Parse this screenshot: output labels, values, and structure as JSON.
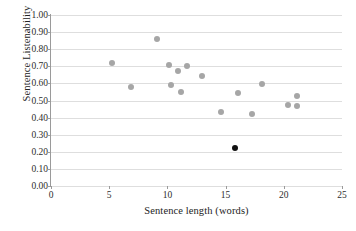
{
  "chart_data": {
    "type": "scatter",
    "title": "",
    "xlabel": "Sentence length (words)",
    "ylabel": "Sentence Listenability",
    "xlim": [
      0,
      25
    ],
    "ylim": [
      0.0,
      1.0
    ],
    "xticks": [
      0,
      5,
      10,
      15,
      20,
      25
    ],
    "xtick_labels": [
      "0",
      "5",
      "10",
      "15",
      "20",
      "25"
    ],
    "yticks": [
      0.0,
      0.1,
      0.2,
      0.3,
      0.4,
      0.5,
      0.6,
      0.7,
      0.8,
      0.9,
      1.0
    ],
    "ytick_labels": [
      "0.00",
      "0.10",
      "0.20",
      "0.30",
      "0.40",
      "0.50",
      "0.60",
      "0.70",
      "0.80",
      "0.90",
      "1.00"
    ],
    "grid": "horizontal",
    "legend": "none",
    "series": [
      {
        "name": "corpus-sentences",
        "color": "#a6a6a6",
        "marker": "circle",
        "points": [
          {
            "x": 5.2,
            "y": 0.72
          },
          {
            "x": 6.9,
            "y": 0.58
          },
          {
            "x": 9.1,
            "y": 0.86
          },
          {
            "x": 10.1,
            "y": 0.71
          },
          {
            "x": 10.3,
            "y": 0.59
          },
          {
            "x": 10.9,
            "y": 0.67
          },
          {
            "x": 11.2,
            "y": 0.55
          },
          {
            "x": 11.7,
            "y": 0.7
          },
          {
            "x": 13.0,
            "y": 0.645
          },
          {
            "x": 14.6,
            "y": 0.435
          },
          {
            "x": 16.1,
            "y": 0.545
          },
          {
            "x": 17.3,
            "y": 0.42
          },
          {
            "x": 18.1,
            "y": 0.595
          },
          {
            "x": 20.4,
            "y": 0.475
          },
          {
            "x": 21.1,
            "y": 0.525
          },
          {
            "x": 21.1,
            "y": 0.465
          }
        ]
      },
      {
        "name": "target-sentence",
        "color": "#111111",
        "marker": "circle",
        "points": [
          {
            "x": 15.8,
            "y": 0.225
          }
        ]
      }
    ]
  }
}
